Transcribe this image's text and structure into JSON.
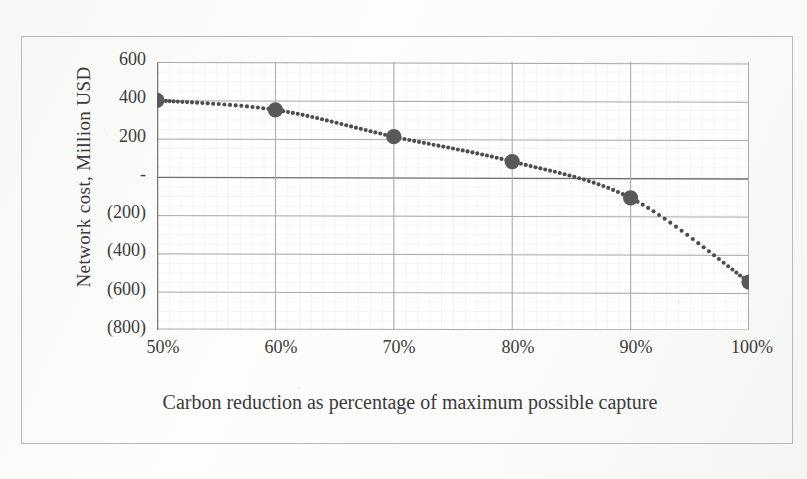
{
  "chart_data": {
    "type": "line",
    "title": "",
    "xlabel": "Carbon reduction as percentage of maximum possible capture",
    "ylabel": "Network cost, Million USD",
    "x": [
      50,
      60,
      70,
      80,
      90,
      100
    ],
    "categories": [
      "50%",
      "60%",
      "70%",
      "80%",
      "90%",
      "100%"
    ],
    "values": [
      400,
      350,
      210,
      80,
      -110,
      -550
    ],
    "series": [
      {
        "name": "Network cost",
        "values": [
          400,
          350,
          210,
          80,
          -110,
          -550
        ]
      }
    ],
    "xlim": [
      50,
      100
    ],
    "ylim": [
      -800,
      600
    ],
    "y_ticks": [
      600,
      400,
      200,
      0,
      -200,
      -400,
      -600,
      -800
    ],
    "y_tick_labels": [
      "600",
      "400",
      "200",
      "-",
      "(200)",
      "(400)",
      "(600)",
      "(800)"
    ],
    "x_ticks": [
      50,
      60,
      70,
      80,
      90,
      100
    ],
    "x_tick_labels": [
      "50%",
      "60%",
      "70%",
      "80%",
      "90%",
      "100%"
    ],
    "grid": true,
    "minor_grid": true,
    "legend": "none",
    "marker": "circle",
    "line_style": "dotted",
    "colors": {
      "marker": "#595959",
      "line": "#4d4d4d",
      "major_grid": "#a8a8a8",
      "minor_grid": "#dcdcdc",
      "zero_line": "#6f6f6f",
      "axis": "#7a7a7a",
      "text": "#3c3c3c"
    }
  },
  "axis": {
    "y_title": "Network cost, Million USD",
    "x_title_line1": "Carbon reduction as percentage of maximum possible",
    "x_title_line2": "capture",
    "y_labels": {
      "t600": "600",
      "t400": "400",
      "t200": "200",
      "t0": "-",
      "tm200": "(200)",
      "tm400": "(400)",
      "tm600": "(600)",
      "tm800": "(800)"
    },
    "x_labels": {
      "p50": "50%",
      "p60": "60%",
      "p70": "70%",
      "p80": "80%",
      "p90": "90%",
      "p100": "100%"
    }
  }
}
